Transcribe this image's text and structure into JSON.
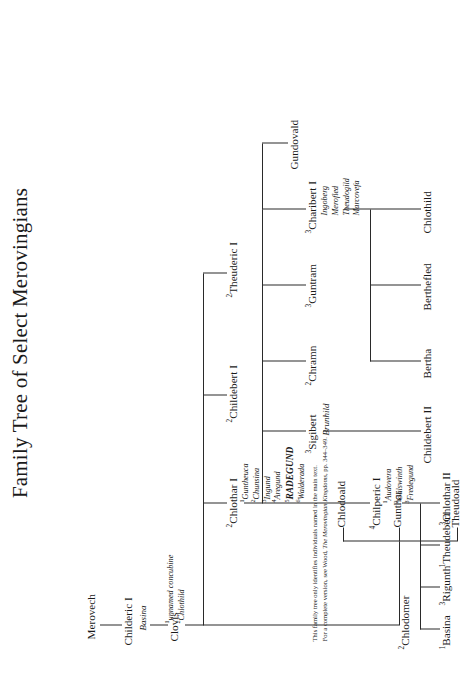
{
  "document": {
    "title": "Family Tree of Select Merovingians"
  },
  "footnote": {
    "line1": "This family tree only identifies individuals named in the main text.",
    "line2_prefix": "For a complete version, see Wood, ",
    "line2_italic": "The Merovingian Kingdoms",
    "line2_suffix": ", pp. 344–349."
  },
  "tree": {
    "generation1": {
      "merovech": "Merovech"
    },
    "generation2": {
      "childeric": "Childeric I",
      "childeric_spouse": "Basina"
    },
    "generation3": {
      "clovis": "Clovis",
      "clovis_spouses": [
        {
          "num": "1",
          "name": "unnamed concubine"
        },
        {
          "num": "2",
          "name": "Chlothild"
        }
      ]
    },
    "generation4": {
      "theuderic": {
        "num": "2",
        "name": "Theuderic I"
      },
      "childebert": {
        "num": "2",
        "name": "Childebert I"
      },
      "chlothar": {
        "num": "2",
        "name": "Chlothar I"
      },
      "chlodomer": {
        "num": "2",
        "name": "Chlodomer"
      },
      "chlothar_spouses": [
        {
          "num": "1",
          "name": "Guntheuca",
          "emph": false
        },
        {
          "num": "2",
          "name": "Chunsina",
          "emph": false
        },
        {
          "num": "3",
          "name": "Ingund",
          "emph": false
        },
        {
          "num": "4",
          "name": "Aregund",
          "emph": false
        },
        {
          "num": "5",
          "name": "RADEGUND",
          "emph": true
        },
        {
          "num": "6",
          "name": "Walderada",
          "emph": false
        }
      ]
    },
    "generation5": {
      "gundovald": "Gundovald",
      "charibert": {
        "num": "3",
        "name": "Charibert I"
      },
      "charibert_spouses": [
        "Ingoberg",
        "Merofled",
        "Theudogild",
        "Marcovefa"
      ],
      "guntram": {
        "num": "3",
        "name": "Guntram"
      },
      "chramn": {
        "num": "2",
        "name": "Chramn"
      },
      "sigibert": {
        "num": "3",
        "name": "Sigibert"
      },
      "sigibert_spouse": "Brunhild",
      "chilperic": {
        "num": "4",
        "name": "Chilperic I"
      },
      "chilperic_spouses": [
        {
          "num": "1",
          "name": "Audovera"
        },
        {
          "num": "2",
          "name": "Galswinth"
        },
        {
          "num": "3",
          "name": "Fredegund"
        }
      ],
      "theudoald": "Theudoald",
      "gunthar": "Gunthar",
      "chlodoald": "Chlodoald"
    },
    "generation6": {
      "chlothild": "Chlothild",
      "berthefled": "Berthefled",
      "bertha": "Bertha",
      "childebert_ii": "Childebert II",
      "chlothar_ii": {
        "num": "3",
        "name": "Chlothar II"
      },
      "theudebert": {
        "num": "1",
        "name": "Theudebert"
      },
      "rigunth": {
        "num": "3",
        "name": "Rigunth"
      },
      "basina": {
        "num": "1",
        "name": "Basina"
      }
    }
  }
}
